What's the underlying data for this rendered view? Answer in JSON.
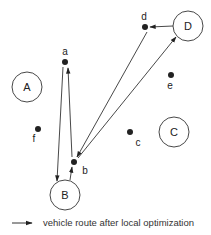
{
  "diagram": {
    "depots": [
      {
        "id": "A",
        "label": "A",
        "cx": 27,
        "cy": 87,
        "r": 15
      },
      {
        "id": "B",
        "label": "B",
        "cx": 65,
        "cy": 195,
        "r": 15
      },
      {
        "id": "C",
        "label": "C",
        "cx": 174,
        "cy": 132,
        "r": 15
      },
      {
        "id": "D",
        "label": "D",
        "cx": 188,
        "cy": 26,
        "r": 15
      }
    ],
    "customers": [
      {
        "id": "a",
        "label": "a",
        "cx": 65,
        "cy": 62,
        "lx": 65,
        "ly": 55
      },
      {
        "id": "b",
        "label": "b",
        "cx": 74,
        "cy": 162,
        "lx": 85,
        "ly": 174
      },
      {
        "id": "c",
        "label": "c",
        "cx": 130,
        "cy": 132,
        "lx": 138,
        "ly": 146
      },
      {
        "id": "d",
        "label": "d",
        "cx": 145,
        "cy": 27,
        "lx": 144,
        "ly": 20
      },
      {
        "id": "e",
        "label": "e",
        "cx": 171,
        "cy": 75,
        "lx": 170,
        "ly": 89
      },
      {
        "id": "f",
        "label": "f",
        "cx": 38,
        "cy": 129,
        "lx": 34,
        "ly": 142
      }
    ],
    "routes": [
      {
        "from": "B",
        "to": "b",
        "x1": 70,
        "y1": 180,
        "x2": 72,
        "y2": 167
      },
      {
        "from": "b",
        "to": "D",
        "x1": 78,
        "y1": 158,
        "x2": 176,
        "y2": 37
      },
      {
        "from": "D",
        "to": "d",
        "x1": 173,
        "y1": 26,
        "x2": 150,
        "y2": 27
      },
      {
        "from": "d",
        "to": "b",
        "x1": 147,
        "y1": 32,
        "x2": 77,
        "y2": 157
      },
      {
        "from": "b",
        "to": "a",
        "x1": 72,
        "y1": 157,
        "x2": 68,
        "y2": 68
      },
      {
        "from": "a",
        "to": "B",
        "x1": 63,
        "y1": 67,
        "x2": 57,
        "y2": 181
      }
    ],
    "colors": {
      "stroke": "#333333",
      "dot": "#222222",
      "fill": "#ffffff"
    }
  },
  "legend": {
    "label": "vehicle route after local optimization",
    "arrow": {
      "x1": 12,
      "y1": 223,
      "x2": 32,
      "y2": 223
    }
  }
}
